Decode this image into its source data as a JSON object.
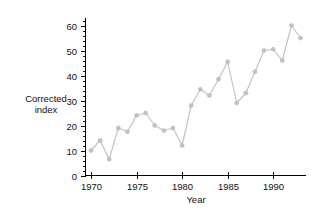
{
  "chart_data": {
    "type": "line",
    "title": "",
    "xlabel": "Year",
    "ylabel": "Corrected index",
    "x": [
      1970,
      1971,
      1972,
      1973,
      1974,
      1975,
      1976,
      1977,
      1978,
      1979,
      1980,
      1981,
      1982,
      1983,
      1984,
      1985,
      1986,
      1987,
      1988,
      1989,
      1990,
      1991,
      1992,
      1993
    ],
    "values": [
      10,
      14,
      6.5,
      19,
      17.5,
      24,
      25,
      20,
      18,
      19,
      12,
      28,
      34.5,
      32,
      38.5,
      45.5,
      29,
      33,
      41.5,
      50,
      50.5,
      46,
      60,
      55
    ],
    "series": [
      {
        "name": "Corrected index",
        "values": [
          10,
          14,
          6.5,
          19,
          17.5,
          24,
          25,
          20,
          18,
          19,
          12,
          28,
          34.5,
          32,
          38.5,
          45.5,
          29,
          33,
          41.5,
          50,
          50.5,
          46,
          60,
          55
        ]
      }
    ],
    "xlim": [
      1969.4,
      1993.6
    ],
    "ylim": [
      0,
      63
    ],
    "xticks": [
      1970,
      1975,
      1980,
      1985,
      1990
    ],
    "xtick_labels": [
      "1970",
      "1975",
      "1980",
      "1985",
      "1990"
    ],
    "yticks": [
      0,
      10,
      20,
      30,
      40,
      50,
      60
    ],
    "ytick_labels": [
      "0",
      "10",
      "20",
      "30",
      "40",
      "50",
      "60"
    ],
    "y_minor_tick_step": 2,
    "grid": false,
    "legend": "none",
    "marker": "circle",
    "line_color": "#c2c2c2",
    "marker_color": "#c2c2c2",
    "axis_color": "#000000",
    "background_color": "#ffffff"
  },
  "labels": {
    "y_axis_line1": "Corrected",
    "y_axis_line2": "index",
    "x_axis_title": "Year"
  }
}
